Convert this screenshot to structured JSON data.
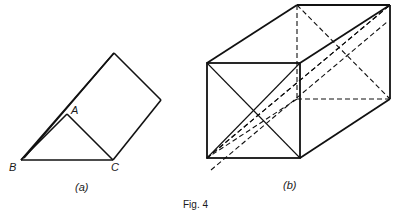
{
  "figure": {
    "caption": "Fig. 4",
    "line_color": "#111111",
    "panels": [
      {
        "id": "a",
        "label": "(a)",
        "shape": "triangular prism",
        "vertex_labels": {
          "A": "A",
          "B": "B",
          "C": "C"
        }
      },
      {
        "id": "b",
        "label": "(b)",
        "shape": "cuboid with face and space diagonals"
      }
    ]
  }
}
